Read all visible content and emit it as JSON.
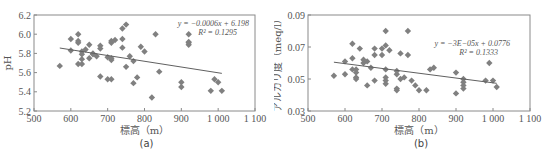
{
  "figure": {
    "panels": [
      "a",
      "b"
    ]
  },
  "chart_data": [
    {
      "id": "a",
      "type": "scatter",
      "caption": "(a)",
      "title": "",
      "xlabel": "標高（m）",
      "ylabel": "pH",
      "xlim": [
        500,
        1100
      ],
      "ylim": [
        5.2,
        6.2
      ],
      "xticks": [
        500,
        600,
        700,
        800,
        900,
        1000,
        1100
      ],
      "xtick_labels": [
        "500",
        "600",
        "700",
        "800",
        "900",
        "1 000",
        "1 100"
      ],
      "yticks": [
        5.2,
        5.4,
        5.6,
        5.8,
        6.0,
        6.2
      ],
      "ytick_labels": [
        "5.2",
        "5.4",
        "5.6",
        "5.8",
        "6.0",
        "6.2"
      ],
      "grid": false,
      "marker_color": "#808080",
      "line_color": "#606060",
      "equation": "y = −0.0006x + 6.198",
      "r2": "R² = 0.1295",
      "trendline": {
        "slope": -0.0006,
        "intercept": 6.198,
        "x_range": [
          570,
          1010
        ]
      },
      "points": [
        [
          570,
          5.67
        ],
        [
          600,
          5.95
        ],
        [
          600,
          5.83
        ],
        [
          620,
          6.0
        ],
        [
          620,
          5.93
        ],
        [
          620,
          5.91
        ],
        [
          620,
          5.69
        ],
        [
          630,
          5.82
        ],
        [
          630,
          5.79
        ],
        [
          630,
          5.74
        ],
        [
          630,
          5.69
        ],
        [
          640,
          5.84
        ],
        [
          650,
          5.89
        ],
        [
          650,
          5.75
        ],
        [
          660,
          5.8
        ],
        [
          660,
          5.79
        ],
        [
          670,
          5.77
        ],
        [
          680,
          5.88
        ],
        [
          680,
          5.85
        ],
        [
          680,
          5.56
        ],
        [
          700,
          5.76
        ],
        [
          700,
          5.53
        ],
        [
          710,
          5.93
        ],
        [
          710,
          5.91
        ],
        [
          710,
          5.75
        ],
        [
          710,
          5.73
        ],
        [
          710,
          5.53
        ],
        [
          720,
          5.94
        ],
        [
          740,
          6.06
        ],
        [
          740,
          5.95
        ],
        [
          740,
          5.86
        ],
        [
          750,
          6.1
        ],
        [
          750,
          5.66
        ],
        [
          760,
          5.77
        ],
        [
          770,
          5.72
        ],
        [
          770,
          5.49
        ],
        [
          780,
          5.55
        ],
        [
          790,
          5.87
        ],
        [
          800,
          5.82
        ],
        [
          820,
          5.34
        ],
        [
          830,
          6.0
        ],
        [
          840,
          5.61
        ],
        [
          900,
          5.5
        ],
        [
          900,
          5.45
        ],
        [
          920,
          6.0
        ],
        [
          920,
          5.92
        ],
        [
          920,
          5.91
        ],
        [
          920,
          5.89
        ],
        [
          980,
          5.41
        ],
        [
          990,
          5.53
        ],
        [
          1000,
          5.5
        ],
        [
          1010,
          5.41
        ]
      ]
    },
    {
      "id": "b",
      "type": "scatter",
      "caption": "(b)",
      "title": "",
      "xlabel": "標高（m）",
      "ylabel": "アルカリ度（meq/l）",
      "xlim": [
        500,
        1100
      ],
      "ylim": [
        0.03,
        0.09
      ],
      "xticks": [
        500,
        600,
        700,
        800,
        900,
        1000,
        1100
      ],
      "xtick_labels": [
        "500",
        "600",
        "700",
        "800",
        "900",
        "1 000",
        "1 100"
      ],
      "yticks": [
        0.03,
        0.05,
        0.07,
        0.09
      ],
      "ytick_labels": [
        "0.03",
        "0.05",
        "0.07",
        "0.09"
      ],
      "grid": false,
      "marker_color": "#808080",
      "line_color": "#606060",
      "equation": "y = −3E−05x + 0.0776",
      "r2": "R² = 0.1333",
      "trendline": {
        "slope": -3e-05,
        "intercept": 0.0776,
        "x_range": [
          570,
          1010
        ]
      },
      "points": [
        [
          570,
          0.052
        ],
        [
          600,
          0.061
        ],
        [
          600,
          0.053
        ],
        [
          620,
          0.072
        ],
        [
          620,
          0.063
        ],
        [
          620,
          0.056
        ],
        [
          630,
          0.056
        ],
        [
          630,
          0.054
        ],
        [
          630,
          0.051
        ],
        [
          630,
          0.05
        ],
        [
          640,
          0.069
        ],
        [
          650,
          0.062
        ],
        [
          650,
          0.06
        ],
        [
          660,
          0.061
        ],
        [
          660,
          0.046
        ],
        [
          670,
          0.057
        ],
        [
          680,
          0.069
        ],
        [
          680,
          0.065
        ],
        [
          680,
          0.049
        ],
        [
          700,
          0.069
        ],
        [
          700,
          0.065
        ],
        [
          710,
          0.08
        ],
        [
          710,
          0.071
        ],
        [
          710,
          0.056
        ],
        [
          710,
          0.051
        ],
        [
          710,
          0.049
        ],
        [
          710,
          0.047
        ],
        [
          720,
          0.068
        ],
        [
          740,
          0.055
        ],
        [
          740,
          0.053
        ],
        [
          740,
          0.044
        ],
        [
          740,
          0.043
        ],
        [
          750,
          0.066
        ],
        [
          750,
          0.05
        ],
        [
          760,
          0.051
        ],
        [
          770,
          0.08
        ],
        [
          770,
          0.065
        ],
        [
          780,
          0.049
        ],
        [
          790,
          0.046
        ],
        [
          800,
          0.043
        ],
        [
          820,
          0.043
        ],
        [
          830,
          0.056
        ],
        [
          840,
          0.057
        ],
        [
          900,
          0.054
        ],
        [
          900,
          0.041
        ],
        [
          920,
          0.05
        ],
        [
          920,
          0.048
        ],
        [
          920,
          0.046
        ],
        [
          920,
          0.044
        ],
        [
          980,
          0.049
        ],
        [
          990,
          0.06
        ],
        [
          1000,
          0.049
        ],
        [
          1010,
          0.045
        ]
      ]
    }
  ]
}
